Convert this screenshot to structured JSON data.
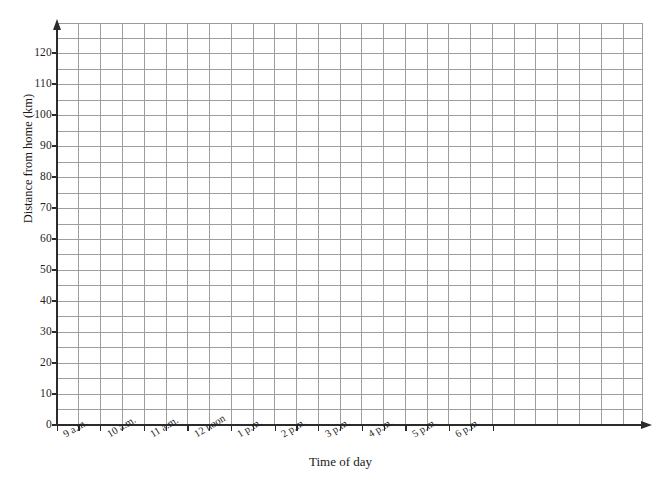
{
  "chart_data": {
    "type": "line",
    "title": "",
    "subtitle": "",
    "xlabel": "Time of day",
    "ylabel": "Distance from home (km)",
    "grid": true,
    "legend": false,
    "legend_position": "none",
    "series": [],
    "x": [
      "9 a.m.",
      "10 a.m.",
      "11 a.m.",
      "12 noon",
      "1 p.m.",
      "2 p.m.",
      "3 p.m.",
      "4 p.m.",
      "5 p.m.",
      "6 p.m."
    ],
    "xtick_labels": [
      "9 a.m.",
      "10 a.m.",
      "11 a.m.",
      "12 noon",
      "1 p.m.",
      "2 p.m.",
      "3 p.m.",
      "4 p.m.",
      "5 p.m.",
      "6 p.m."
    ],
    "ytick_labels": [
      "0",
      "10",
      "20",
      "30",
      "40",
      "50",
      "60",
      "70",
      "80",
      "90",
      "100",
      "110",
      "120"
    ],
    "ytick_values": [
      0,
      10,
      20,
      30,
      40,
      50,
      60,
      70,
      80,
      90,
      100,
      110,
      120
    ],
    "ylim": [
      0,
      130
    ],
    "xlim": [
      0,
      10.5
    ],
    "y_minor_step": 5,
    "x_minor_step": 0.5,
    "grid_color": "#9e9e9e",
    "axis_color": "#2b2b2b",
    "background_color": "#ffffff"
  },
  "axes": {
    "y_title": "Distance from home (km)",
    "x_title": "Time of day"
  }
}
